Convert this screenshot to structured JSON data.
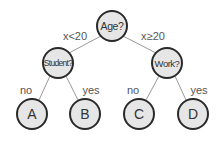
{
  "diagram": {
    "type": "decision-tree",
    "nodes": {
      "root": {
        "label": "Age?",
        "cx": 112,
        "cy": 26,
        "r": 15
      },
      "left": {
        "label": "Student?",
        "cx": 58,
        "cy": 63,
        "r": 15
      },
      "right": {
        "label": "Work?",
        "cx": 167,
        "cy": 63,
        "r": 15
      },
      "leaf_a": {
        "label": "A",
        "cx": 32,
        "cy": 114,
        "r": 15
      },
      "leaf_b": {
        "label": "B",
        "cx": 85,
        "cy": 114,
        "r": 15
      },
      "leaf_c": {
        "label": "C",
        "cx": 139,
        "cy": 114,
        "r": 15
      },
      "leaf_d": {
        "label": "D",
        "cx": 193,
        "cy": 114,
        "r": 15
      }
    },
    "edges": {
      "root_left": {
        "label": "x<20"
      },
      "root_right": {
        "label": "x≥20"
      },
      "left_a": {
        "label": "no"
      },
      "left_b": {
        "label": "yes"
      },
      "right_c": {
        "label": "no"
      },
      "right_d": {
        "label": "yes"
      }
    },
    "colors": {
      "node_fill": "#e6e6e6",
      "node_stroke": "#2a2a2a",
      "edge_stroke": "#9a9a9a",
      "text": "#333333"
    }
  }
}
